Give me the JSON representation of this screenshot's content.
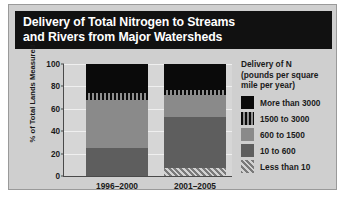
{
  "figure": {
    "title_lines": [
      "Delivery of Total Nitrogen to Streams",
      "and Rivers from Major Watersheds"
    ],
    "background_color": "#cfcfcf",
    "title_banner_color": "#111111",
    "plot_background_color": "#d6d6d6"
  },
  "chart_data": {
    "type": "bar",
    "title": "Delivery of Total Nitrogen to Streams and Rivers from Major Watersheds",
    "subtype": "stacked-100-percent",
    "xlabel": "",
    "ylabel": "% of Total Lands Measured",
    "ylim": [
      0,
      100
    ],
    "yticks": [
      0,
      20,
      40,
      60,
      80,
      100
    ],
    "ytick_labels": [
      "0",
      "20",
      "40",
      "60",
      "80",
      "100"
    ],
    "grid": true,
    "legend_position": "right",
    "legend_title_lines": [
      "Delivery of N",
      "(pounds per square",
      "mile per year)"
    ],
    "categories": [
      "1996–2000",
      "2001–2005"
    ],
    "series": [
      {
        "name": "More than 3000",
        "pattern": "solid",
        "color": "#0a0a0a",
        "values": [
          26,
          23
        ]
      },
      {
        "name": "1500 to 3000",
        "pattern": "vertical-stripes",
        "color": "#1c1c1c",
        "values": [
          6,
          5
        ]
      },
      {
        "name": "600 to 1500",
        "pattern": "solid",
        "color": "#8a8a8a",
        "values": [
          43,
          19
        ]
      },
      {
        "name": "10 to 600",
        "pattern": "solid",
        "color": "#5e5e5e",
        "values": [
          25,
          46
        ]
      },
      {
        "name": "Less than 10",
        "pattern": "diagonal-hatch",
        "color": "#9d9d9d",
        "values": [
          0,
          7
        ]
      }
    ]
  }
}
